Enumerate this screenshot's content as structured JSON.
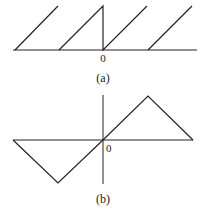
{
  "figure_a": {
    "caption": "(a)",
    "origin_label": "0",
    "description": "sawtooth waveform",
    "stroke_color": "#222222"
  },
  "figure_b": {
    "caption": "(b)",
    "origin_label": "0",
    "description": "triangular waveform",
    "stroke_color": "#222222"
  }
}
